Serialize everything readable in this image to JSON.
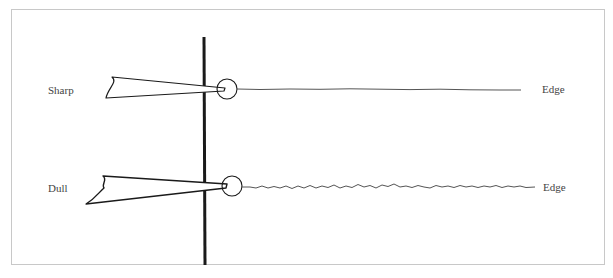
{
  "diagram": {
    "title": "",
    "rows": [
      {
        "id": "sharp",
        "left_label": "Sharp",
        "right_label": "Edge",
        "edge_style": "smooth"
      },
      {
        "id": "dull",
        "left_label": "Dull",
        "right_label": "Edge",
        "edge_style": "jagged"
      }
    ],
    "colors": {
      "ink": "#1a1a1a",
      "edge_line": "#555555",
      "frame": "#c8c8c8",
      "label": "#444444"
    }
  }
}
